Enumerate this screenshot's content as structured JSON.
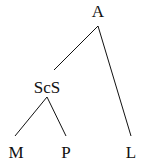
{
  "diagram": {
    "type": "tree",
    "nodes": [
      {
        "id": "A",
        "label": "A",
        "x": 98,
        "y": 4
      },
      {
        "id": "ScS",
        "label": "ScS",
        "x": 47,
        "y": 80
      },
      {
        "id": "M",
        "label": "M",
        "x": 16,
        "y": 145
      },
      {
        "id": "P",
        "label": "P",
        "x": 66,
        "y": 145
      },
      {
        "id": "L",
        "label": "L",
        "x": 131,
        "y": 145
      }
    ],
    "edges": [
      {
        "from": "A",
        "to": "ScS"
      },
      {
        "from": "A",
        "to": "L"
      },
      {
        "from": "ScS",
        "to": "M"
      },
      {
        "from": "ScS",
        "to": "P"
      }
    ]
  }
}
